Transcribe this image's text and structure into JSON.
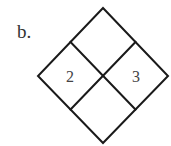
{
  "label": "b.",
  "diagram": {
    "shape": "diamond divided into 4 cells",
    "cells": {
      "top": "",
      "left": "2",
      "right": "3",
      "bottom": ""
    },
    "stroke_color": "#1a1a1a"
  }
}
